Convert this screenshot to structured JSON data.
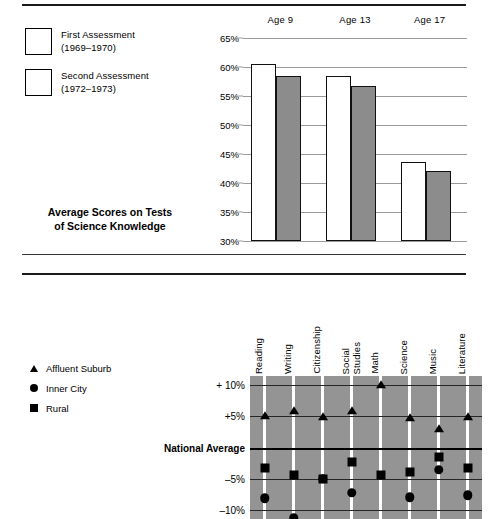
{
  "top_panel": {
    "caption": "Average Scores on Tests\nof Science Knowledge",
    "caption_line1": "Average Scores on Tests",
    "caption_line2": "of Science Knowledge",
    "legend": [
      {
        "label_line1": "First Assessment",
        "label_line2": "(1969–1970)",
        "fill": "#ffffff"
      },
      {
        "label_line1": "Second Assessment",
        "label_line2": "(1972–1973)",
        "fill": "#ffffff"
      }
    ]
  },
  "bottom_panel": {
    "legend": [
      {
        "marker": "triangle-marker",
        "label": "Affluent Suburb"
      },
      {
        "marker": "circle-marker",
        "label": "Inner City"
      },
      {
        "marker": "square-marker",
        "label": "Rural"
      }
    ]
  },
  "chart_data": [
    {
      "type": "bar",
      "title": "Average Scores on Tests of Science Knowledge",
      "xlabel": "",
      "ylabel": "",
      "categories": [
        "Age 9",
        "Age 13",
        "Age 17"
      ],
      "tick_labels": [
        "65%",
        "60%",
        "55%",
        "50%",
        "45%",
        "40%",
        "35%",
        "30%"
      ],
      "ylim": [
        30,
        65
      ],
      "grid": true,
      "legend_position": "left",
      "series": [
        {
          "name": "First Assessment (1969–1970)",
          "fill": "#ffffff",
          "values": [
            60.6,
            58.4,
            43.7
          ]
        },
        {
          "name": "Second Assessment (1972–1973)",
          "fill": "#8c8c8c",
          "values": [
            58.4,
            56.7,
            42.0
          ]
        }
      ]
    },
    {
      "type": "scatter",
      "title": "",
      "xlabel": "",
      "ylabel": "",
      "categories": [
        "Reading",
        "Writing",
        "Citizenship",
        "Social\nStudies",
        "Math",
        "Science",
        "Music",
        "Literature"
      ],
      "tick_labels": [
        "+ 10%",
        "+5%",
        "National Average",
        "–5%",
        "–10%"
      ],
      "tick_values": [
        10,
        5,
        0,
        -5,
        -10
      ],
      "ylim": [
        -11.5,
        11.5
      ],
      "grid": true,
      "legend_position": "left",
      "series": [
        {
          "name": "Affluent Suburb",
          "marker": "triangle",
          "values": [
            5.0,
            5.9,
            4.9,
            5.9,
            10.0,
            4.8,
            3.0,
            4.9
          ]
        },
        {
          "name": "Inner City",
          "marker": "circle",
          "values": [
            -8.2,
            -11.4,
            -5.0,
            -7.3,
            null,
            -8.0,
            -3.6,
            -7.7
          ]
        },
        {
          "name": "Rural",
          "marker": "square",
          "values": [
            -3.3,
            -4.4,
            -5.0,
            -2.4,
            -4.4,
            -4.0,
            -1.5,
            -3.3
          ]
        }
      ]
    }
  ]
}
